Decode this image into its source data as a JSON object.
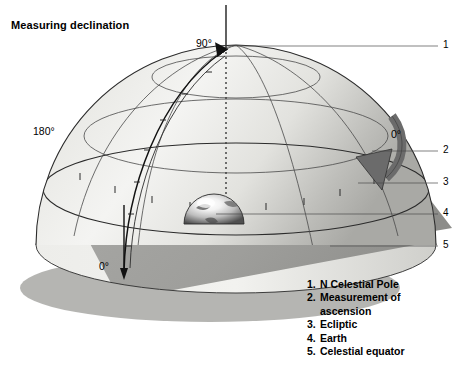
{
  "title": "Measuring declination",
  "diagram": {
    "type": "celestial-sphere-declination",
    "angle_labels": [
      {
        "id": "dec-90",
        "text": "90°",
        "x": 196,
        "y": 44,
        "meaning": "declination 90 degrees at north celestial pole"
      },
      {
        "id": "ra-180",
        "text": "180°",
        "x": 38,
        "y": 132,
        "meaning": "right ascension 180 degrees"
      },
      {
        "id": "ra-0",
        "text": "0°",
        "x": 393,
        "y": 135,
        "meaning": "right ascension 0 degrees"
      },
      {
        "id": "dec-0",
        "text": "0°",
        "x": 101,
        "y": 267,
        "meaning": "declination 0 degrees at celestial equator"
      }
    ],
    "callouts": [
      {
        "number": "1",
        "x": 443,
        "y": 41,
        "line_from_x": 232,
        "line_to_x": 438,
        "line_y": 46
      },
      {
        "number": "2",
        "x": 443,
        "y": 146,
        "line_from_x": 372,
        "line_to_x": 438,
        "line_y": 151
      },
      {
        "number": "3",
        "x": 443,
        "y": 178,
        "line_from_x": 358,
        "line_to_x": 438,
        "line_y": 183
      },
      {
        "number": "4",
        "x": 443,
        "y": 209,
        "line_from_x": 216,
        "line_to_x": 438,
        "line_y": 214
      },
      {
        "number": "5",
        "x": 443,
        "y": 241,
        "line_from_x": 330,
        "line_to_x": 438,
        "line_y": 246
      }
    ],
    "colors": {
      "dome_light": "#f2f2f0",
      "dome_mid": "#dcdcd8",
      "dome_shade": "#b4b4b0",
      "ecliptic_plane": "#9d9d9a",
      "equator_plane": "#e6e6e2",
      "shadow": "#a8a8a4",
      "grid_line": "#4a4a4a",
      "arrow": "#6b6b6b",
      "outline": "#2b2b2b"
    }
  },
  "legend": {
    "items": [
      {
        "number": "1.",
        "label": "N Celestial Pole",
        "continuation": ""
      },
      {
        "number": "2.",
        "label": "Measurement of",
        "continuation": "ascension"
      },
      {
        "number": "3.",
        "label": "Ecliptic",
        "continuation": ""
      },
      {
        "number": "4.",
        "label": "Earth",
        "continuation": ""
      },
      {
        "number": "5.",
        "label": "Celestial equator",
        "continuation": ""
      }
    ]
  }
}
